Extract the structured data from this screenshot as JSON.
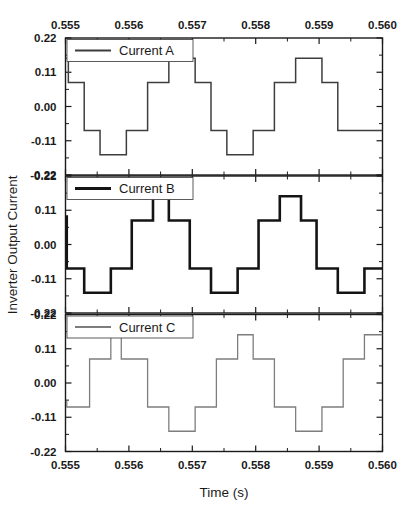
{
  "chart_data": {
    "type": "line",
    "title": "",
    "xlabel": "Time (s)",
    "ylabel": "Inverter Output Current",
    "xlim": [
      0.555,
      0.56
    ],
    "ylim": [
      -0.22,
      0.22
    ],
    "grid": false,
    "legend_position": "top-left inside each panel",
    "x_ticks": [
      "0.555",
      "0.556",
      "0.557",
      "0.558",
      "0.559",
      "0.560"
    ],
    "x_tick_values": [
      0.555,
      0.556,
      0.557,
      0.558,
      0.559,
      0.56
    ],
    "x_minor_ticks": [
      0.5555,
      0.5565,
      0.5575,
      0.5585,
      0.5595
    ],
    "y_ticks": [
      "0.22",
      "0.11",
      "0.00",
      "-0.11",
      "-0.22"
    ],
    "y_tick_values": [
      0.22,
      0.11,
      0.0,
      -0.11,
      -0.22
    ],
    "x_axis_top_labeled": true,
    "x_axis_bottom_labeled": true,
    "panels": [
      {
        "name": "panel-current-a",
        "legend_label": "Current A",
        "color": "#3d3d3d",
        "line_width": 1.5,
        "phase_deg": 0,
        "waveform_kind": "multilevel-staircase",
        "period_s": 0.002,
        "levels": [
          -0.155,
          -0.077,
          0.0,
          0.077,
          0.155
        ],
        "points": [
          [
            0.555,
            0.155
          ],
          [
            0.555045,
            0.155
          ],
          [
            0.555045,
            0.077
          ],
          [
            0.555295,
            0.077
          ],
          [
            0.555295,
            -0.077
          ],
          [
            0.555545,
            -0.077
          ],
          [
            0.555545,
            -0.155
          ],
          [
            0.55596,
            -0.155
          ],
          [
            0.55596,
            -0.077
          ],
          [
            0.556295,
            -0.077
          ],
          [
            0.556295,
            0.077
          ],
          [
            0.55663,
            0.077
          ],
          [
            0.55663,
            0.155
          ],
          [
            0.557045,
            0.155
          ],
          [
            0.557045,
            0.077
          ],
          [
            0.557295,
            0.077
          ],
          [
            0.557295,
            -0.077
          ],
          [
            0.557545,
            -0.077
          ],
          [
            0.557545,
            -0.155
          ],
          [
            0.55796,
            -0.155
          ],
          [
            0.55796,
            -0.077
          ],
          [
            0.558295,
            -0.077
          ],
          [
            0.558295,
            0.077
          ],
          [
            0.55863,
            0.077
          ],
          [
            0.55863,
            0.155
          ],
          [
            0.559045,
            0.155
          ],
          [
            0.559045,
            0.077
          ],
          [
            0.559295,
            0.077
          ],
          [
            0.559295,
            -0.077
          ],
          [
            0.56,
            -0.077
          ]
        ]
      },
      {
        "name": "panel-current-b",
        "legend_label": "Current B",
        "color": "#141414",
        "line_width": 2.6,
        "phase_deg": 120,
        "waveform_kind": "multilevel-staircase",
        "period_s": 0.002,
        "levels": [
          -0.155,
          -0.077,
          0.0,
          0.077,
          0.155
        ],
        "points": [
          [
            0.555,
            0.09
          ],
          [
            0.55502,
            0.09
          ],
          [
            0.55502,
            -0.077
          ],
          [
            0.555295,
            -0.077
          ],
          [
            0.555295,
            -0.155
          ],
          [
            0.555715,
            -0.155
          ],
          [
            0.555715,
            -0.077
          ],
          [
            0.556045,
            -0.077
          ],
          [
            0.556045,
            0.077
          ],
          [
            0.55638,
            0.077
          ],
          [
            0.55638,
            0.155
          ],
          [
            0.55663,
            0.155
          ],
          [
            0.55663,
            0.077
          ],
          [
            0.55696,
            0.077
          ],
          [
            0.55696,
            -0.077
          ],
          [
            0.557295,
            -0.077
          ],
          [
            0.557295,
            -0.155
          ],
          [
            0.557715,
            -0.155
          ],
          [
            0.557715,
            -0.077
          ],
          [
            0.558045,
            -0.077
          ],
          [
            0.558045,
            0.077
          ],
          [
            0.55838,
            0.077
          ],
          [
            0.55838,
            0.155
          ],
          [
            0.558715,
            0.155
          ],
          [
            0.558715,
            0.077
          ],
          [
            0.55896,
            0.077
          ],
          [
            0.55896,
            -0.077
          ],
          [
            0.559295,
            -0.077
          ],
          [
            0.559295,
            -0.155
          ],
          [
            0.559715,
            -0.155
          ],
          [
            0.559715,
            -0.077
          ],
          [
            0.56,
            -0.077
          ]
        ]
      },
      {
        "name": "panel-current-c",
        "legend_label": "Current C",
        "color": "#7d7d7d",
        "line_width": 1.3,
        "phase_deg": 240,
        "waveform_kind": "multilevel-staircase",
        "period_s": 0.002,
        "levels": [
          -0.155,
          -0.077,
          0.0,
          0.077,
          0.155
        ],
        "points": [
          [
            0.555,
            -0.06
          ],
          [
            0.55502,
            -0.06
          ],
          [
            0.55502,
            -0.077
          ],
          [
            0.55538,
            -0.077
          ],
          [
            0.55538,
            0.077
          ],
          [
            0.555715,
            0.077
          ],
          [
            0.555715,
            0.155
          ],
          [
            0.55588,
            0.155
          ],
          [
            0.55588,
            0.077
          ],
          [
            0.556295,
            0.077
          ],
          [
            0.556295,
            -0.077
          ],
          [
            0.55663,
            -0.077
          ],
          [
            0.55663,
            -0.155
          ],
          [
            0.557045,
            -0.155
          ],
          [
            0.557045,
            -0.077
          ],
          [
            0.55738,
            -0.077
          ],
          [
            0.55738,
            0.077
          ],
          [
            0.557715,
            0.077
          ],
          [
            0.557715,
            0.155
          ],
          [
            0.55796,
            0.155
          ],
          [
            0.55796,
            0.077
          ],
          [
            0.558295,
            0.077
          ],
          [
            0.558295,
            -0.077
          ],
          [
            0.55863,
            -0.077
          ],
          [
            0.55863,
            -0.155
          ],
          [
            0.559045,
            -0.155
          ],
          [
            0.559045,
            -0.077
          ],
          [
            0.55938,
            -0.077
          ],
          [
            0.55938,
            0.077
          ],
          [
            0.559715,
            0.077
          ],
          [
            0.559715,
            0.155
          ],
          [
            0.56,
            0.155
          ]
        ]
      }
    ]
  }
}
